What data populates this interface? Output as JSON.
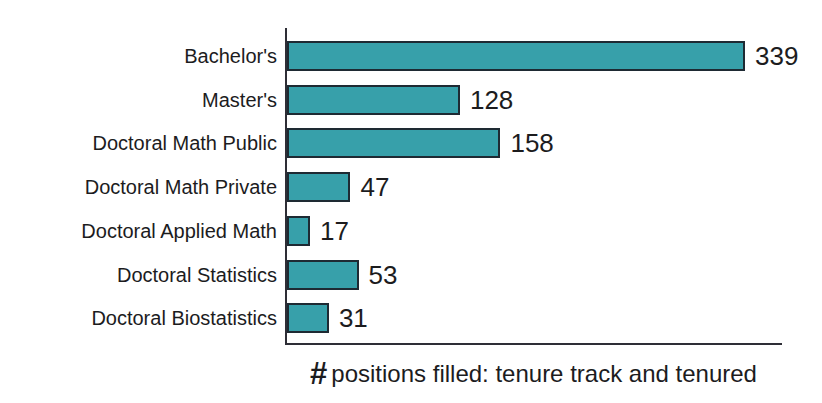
{
  "chart_data": {
    "type": "bar",
    "orientation": "horizontal",
    "title": "",
    "xlabel": "# positions filled: tenure track and tenured",
    "xlabel_hash": "#",
    "xlabel_rest": "positions filled: tenure track and tenured",
    "categories": [
      "Bachelor's",
      "Master's",
      "Doctoral Math Public",
      "Doctoral Math Private",
      "Doctoral Applied Math",
      "Doctoral Statistics",
      "Doctoral Biostatistics"
    ],
    "values": [
      339,
      128,
      158,
      47,
      17,
      53,
      31
    ],
    "data_labels_shown": true,
    "xlim": [
      0,
      366
    ],
    "ticks_shown": false,
    "grid": false,
    "legend": false,
    "bar_color": "#37A0AA",
    "bar_border_color": "#1E2A33",
    "axis_color": "#2E2E36",
    "text_color": "#1C1C1E",
    "background_color": "#FFFFFF"
  }
}
